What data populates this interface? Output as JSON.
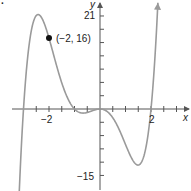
{
  "figure": {
    "corner_label": ".",
    "axis_x_label": "x",
    "axis_y_label": "y",
    "tick_labels": {
      "x_neg": "−2",
      "x_pos": "2",
      "y_top": "21",
      "y_bottom": "−15"
    },
    "point_label": "(−2, 16)",
    "colors": {
      "curve": "#9a9a9a",
      "axis": "#555555",
      "point": "#111111",
      "text": "#222222"
    }
  },
  "chart_data": {
    "type": "line",
    "title": "",
    "xlabel": "x",
    "ylabel": "y",
    "function": "f(x) = x^2 (x+3)(x+1)(x-2)",
    "x_ticks_step": 0.5,
    "y_ticks_step": 3,
    "labeled_x_ticks": [
      -2,
      2
    ],
    "labeled_y_ticks": [
      21,
      -15
    ],
    "xlim": [
      -3.9,
      3.5
    ],
    "ylim": [
      -20,
      24
    ],
    "grid": false,
    "legend": null,
    "annotations": [
      {
        "x": -2,
        "y": 16,
        "text": "(−2, 16)",
        "marker": "filled-circle"
      }
    ],
    "key_points": {
      "x_intercepts": [
        -3,
        -1,
        0,
        2
      ],
      "local_max": [
        -2.43,
        21.2
      ],
      "local_min": [
        1.53,
        -12.9
      ],
      "small_local_min": [
        -0.5,
        -0.5
      ]
    },
    "series": [
      {
        "name": "f(x)",
        "x": [
          -3.2,
          -3.0,
          -2.8,
          -2.6,
          -2.43,
          -2.2,
          -2.0,
          -1.8,
          -1.6,
          -1.4,
          -1.2,
          -1.0,
          -0.8,
          -0.6,
          -0.4,
          -0.2,
          0.0,
          0.2,
          0.4,
          0.6,
          0.8,
          1.0,
          1.2,
          1.4,
          1.53,
          1.7,
          1.9,
          2.0,
          2.2,
          2.4
        ],
        "values": [
          -22.3,
          0.0,
          14.1,
          20.1,
          21.2,
          20.2,
          16.0,
          10.9,
          6.1,
          2.6,
          0.6,
          0.0,
          -0.2,
          -0.3,
          -0.2,
          -0.1,
          0.0,
          -0.2,
          -1.0,
          -2.5,
          -4.9,
          -8.0,
          -11.1,
          -12.8,
          -12.9,
          -10.8,
          -4.6,
          0.0,
          13.2,
          35.0
        ]
      }
    ]
  }
}
